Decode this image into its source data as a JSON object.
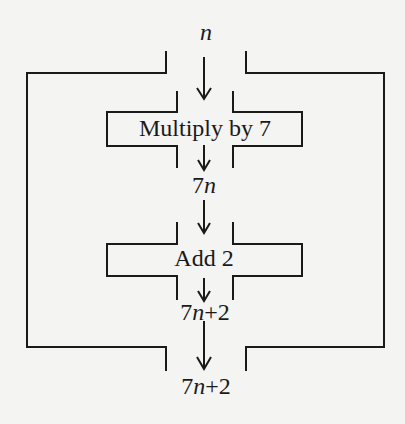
{
  "diagram": {
    "type": "function-machine-flowchart",
    "input_label": "n",
    "outer_machine": {
      "steps": [
        {
          "label": "Multiply by 7",
          "output": {
            "coef": "7",
            "var": "n",
            "rest": ""
          }
        },
        {
          "label": "Add 2",
          "output": {
            "coef": "7",
            "var": "n",
            "rest": "+2"
          }
        }
      ]
    },
    "final_output": {
      "coef": "7",
      "var": "n",
      "rest": "+2"
    },
    "colors": {
      "line": "#1a1a1a",
      "background": "#f4f4f2"
    }
  }
}
